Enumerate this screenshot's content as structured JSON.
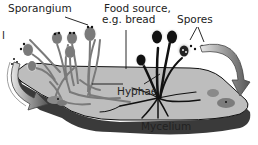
{
  "diagram": {
    "topic": "Bread mold life cycle",
    "labels": {
      "sporangium": "Sporangium",
      "food_source_line1": "Food source,",
      "food_source_line2": "e.g. bread",
      "spores": "Spores",
      "hyphae": "Hyphae",
      "mycelium": "Mycelium",
      "cut_off_left": "l"
    },
    "colors": {
      "bread_top": "#b9b9b9",
      "bread_side": "#3a3a3a",
      "hyphae_gray": "#7a7a7a",
      "hyphae_dark": "#111111",
      "arrow_gray": "#9a9a9a",
      "text": "#222222"
    }
  }
}
